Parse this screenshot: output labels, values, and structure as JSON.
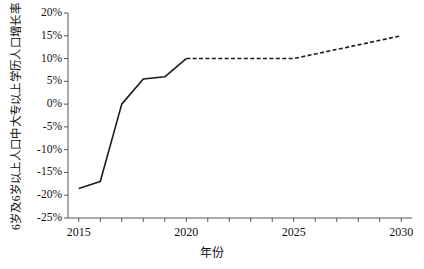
{
  "chart_data": {
    "type": "line",
    "title": "",
    "xlabel": "年份",
    "ylabel": "6岁及6岁以上人口中大专以上学历人口增长率",
    "xlim": [
      2014.5,
      2030.5
    ],
    "ylim": [
      -25,
      20
    ],
    "ytick_values": [
      20,
      15,
      10,
      5,
      0,
      -5,
      -10,
      -15,
      -20,
      -25
    ],
    "ytick_labels": [
      "20%",
      "15%",
      "10%",
      "5%",
      "0%",
      "-5%",
      "-10%",
      "-15%",
      "-20%",
      "-25%"
    ],
    "xtick_values": [
      2015,
      2016,
      2017,
      2018,
      2019,
      2020,
      2021,
      2022,
      2023,
      2024,
      2025,
      2026,
      2027,
      2028,
      2029,
      2030
    ],
    "xtick_labels_shown": [
      {
        "value": 2015,
        "label": "2015"
      },
      {
        "value": 2020,
        "label": "2020"
      },
      {
        "value": 2025,
        "label": "2025"
      },
      {
        "value": 2030,
        "label": "2030"
      }
    ],
    "grid": false,
    "legend": "none",
    "line_color": "#1a1a1a",
    "series": [
      {
        "name": "历史值",
        "style": "solid",
        "x": [
          2015,
          2016,
          2017,
          2018,
          2019,
          2020
        ],
        "values": [
          -18.5,
          -17.0,
          0.0,
          5.5,
          6.0,
          10.0
        ]
      },
      {
        "name": "预测值",
        "style": "dashed",
        "x": [
          2020,
          2021,
          2022,
          2023,
          2024,
          2025,
          2026,
          2027,
          2028,
          2029,
          2030
        ],
        "values": [
          10.0,
          10.0,
          10.0,
          10.0,
          10.0,
          10.0,
          11.0,
          12.0,
          13.0,
          14.0,
          15.0
        ]
      }
    ]
  }
}
